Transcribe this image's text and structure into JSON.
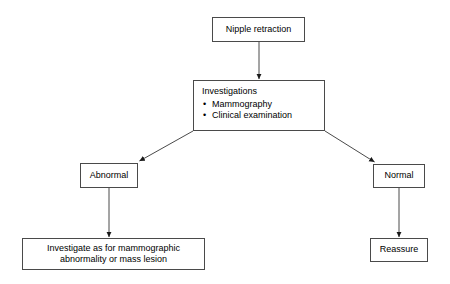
{
  "diagram": {
    "type": "flowchart",
    "background_color": "#ffffff",
    "border_color": "#4a4a4a",
    "text_color": "#000000"
  },
  "nodes": {
    "start": {
      "label": "Nipple retraction"
    },
    "investigations": {
      "title": "Investigations",
      "items": [
        "Mammography",
        "Clinical examination"
      ]
    },
    "abnormal": {
      "label": "Abnormal"
    },
    "normal": {
      "label": "Normal"
    },
    "investigate_further": {
      "line1": "Investigate as for mammographic",
      "line2": "abnormality or mass lesion"
    },
    "reassure": {
      "label": "Reassure"
    }
  },
  "edges": [
    {
      "from": "start",
      "to": "investigations",
      "kind": "vertical-arrow"
    },
    {
      "from": "investigations",
      "to": "abnormal",
      "kind": "diagonal-arrow"
    },
    {
      "from": "investigations",
      "to": "normal",
      "kind": "diagonal-arrow"
    },
    {
      "from": "abnormal",
      "to": "investigate_further",
      "kind": "vertical-arrow"
    },
    {
      "from": "normal",
      "to": "reassure",
      "kind": "vertical-arrow"
    }
  ]
}
